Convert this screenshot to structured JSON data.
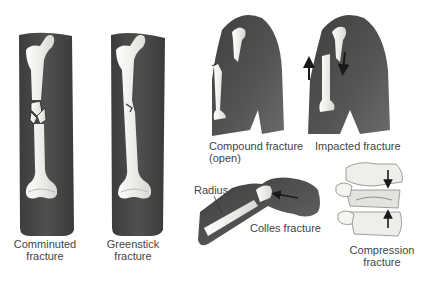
{
  "figure": {
    "panels": [
      {
        "id": "comminuted",
        "label_line1": "Comminuted",
        "label_line2": "fracture"
      },
      {
        "id": "greenstick",
        "label_line1": "Greenstick",
        "label_line2": "fracture"
      },
      {
        "id": "compound",
        "label_line1": "Compound fracture",
        "label_line2": "(open)"
      },
      {
        "id": "impacted",
        "label_line1": "Impacted fracture"
      },
      {
        "id": "colles",
        "label_line1": "Colles fracture",
        "callout": "Radius"
      },
      {
        "id": "compression",
        "label_line1": "Compression",
        "label_line2": "fracture"
      }
    ]
  },
  "colors": {
    "skin": "#4a4a4a",
    "skin_light": "#6e6e6e",
    "bone": "#f2f2ee",
    "bone_shadow": "#c9c9c2",
    "arrow": "#1a1a1a",
    "text": "#444444"
  }
}
